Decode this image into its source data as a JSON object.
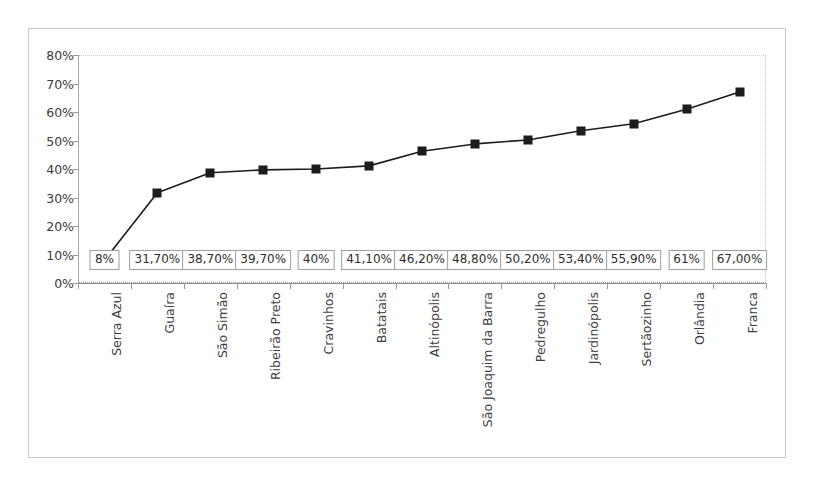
{
  "chart_data": {
    "type": "line",
    "title": "",
    "subtitle": "",
    "xlabel": "",
    "ylabel": "",
    "ylim": [
      0,
      80
    ],
    "y_tick_labels": [
      "0%",
      "10%",
      "20%",
      "30%",
      "40%",
      "50%",
      "60%",
      "70%",
      "80%"
    ],
    "y_ticks": [
      0,
      10,
      20,
      30,
      40,
      50,
      60,
      70,
      80
    ],
    "grid": false,
    "legend": "none",
    "marker": "square",
    "marker_color": "#1c1c1c",
    "line_color": "#1c1c1c",
    "categories": [
      "Serra Azul",
      "Guaíra",
      "São Simão",
      "Ribeirão Preto",
      "Cravinhos",
      "Batatais",
      "Altinópolis",
      "São Joaquim da Barra",
      "Pedregulho",
      "Jardinópolis",
      "Sertãozinho",
      "Orlândia",
      "Franca"
    ],
    "values": [
      8,
      31.7,
      38.7,
      39.7,
      40,
      41.1,
      46.2,
      48.8,
      50.2,
      53.4,
      55.9,
      61,
      67
    ],
    "data_labels": [
      "8%",
      "31,70%",
      "38,70%",
      "39,70%",
      "40%",
      "41,10%",
      "46,20%",
      "48,80%",
      "50,20%",
      "53,40%",
      "55,90%",
      "61%",
      "67,00%"
    ]
  },
  "colors": {
    "frame_border": "#c9c9c9",
    "axis": "#9a9a9a",
    "plot_border": "#c6c6c6",
    "series": "#1c1c1c",
    "label_box_border": "#9e9e9e",
    "text": "#3b3b3b",
    "background": "#ffffff"
  }
}
